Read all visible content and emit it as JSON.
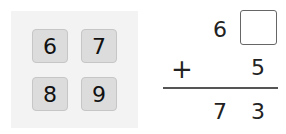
{
  "tiles": [
    {
      "label": "6"
    },
    {
      "label": "7"
    },
    {
      "label": "8"
    },
    {
      "label": "9"
    }
  ],
  "problem": {
    "top_tens": "6",
    "top_ones_blank": "",
    "operator": "+",
    "addend_ones": "5",
    "sum_tens": "7",
    "sum_ones": "3"
  }
}
